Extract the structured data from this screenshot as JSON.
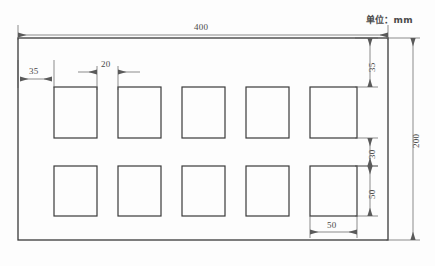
{
  "drawing": {
    "unit_note": "单位：mm",
    "title": "",
    "colors": {
      "background": "#fdfdfd",
      "outline": "#3a3a3a",
      "dimension_line": "#5a5a5a",
      "text": "#4a4a4a"
    },
    "plate": {
      "name": "perforated-plate",
      "width_label": "400",
      "height_label": "200"
    },
    "dimensions": [
      {
        "id": "overall-width",
        "label": "400",
        "orientation": "horizontal",
        "position": "top"
      },
      {
        "id": "overall-height",
        "label": "200",
        "orientation": "vertical",
        "position": "right-outer"
      },
      {
        "id": "edge-margin-left",
        "label": "35",
        "orientation": "horizontal",
        "position": "top-left-inner"
      },
      {
        "id": "hole-gap-horizontal",
        "label": "20",
        "orientation": "horizontal",
        "position": "top-inner"
      },
      {
        "id": "edge-margin-top",
        "label": "35",
        "orientation": "vertical",
        "position": "right-inner-top"
      },
      {
        "id": "row-gap-vertical",
        "label": "30",
        "orientation": "vertical",
        "position": "right-inner-middle"
      },
      {
        "id": "hole-height",
        "label": "50",
        "orientation": "vertical",
        "position": "right-inner-bottom"
      },
      {
        "id": "hole-width",
        "label": "50",
        "orientation": "horizontal",
        "position": "bottom-inner"
      }
    ],
    "holes": {
      "rows": 2,
      "columns": 5,
      "count": 10,
      "shape": "square",
      "size_label": "50"
    }
  }
}
